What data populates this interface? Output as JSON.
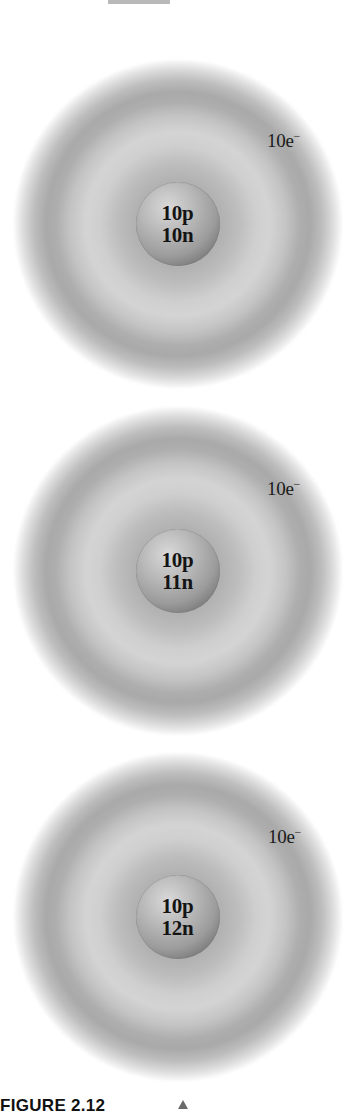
{
  "figure": {
    "caption": "FIGURE 2.12",
    "top_bar_color": "#b9b9b9",
    "atoms": [
      {
        "protons": "10p",
        "neutrons": "10n",
        "electrons": "10e",
        "electron_charge": "−",
        "center": [
          185,
          224
        ]
      },
      {
        "protons": "10p",
        "neutrons": "11n",
        "electrons": "10e",
        "electron_charge": "−",
        "center": [
          185,
          571
        ]
      },
      {
        "protons": "10p",
        "neutrons": "12n",
        "electrons": "10e",
        "electron_charge": "−",
        "center": [
          187,
          917
        ]
      }
    ]
  }
}
